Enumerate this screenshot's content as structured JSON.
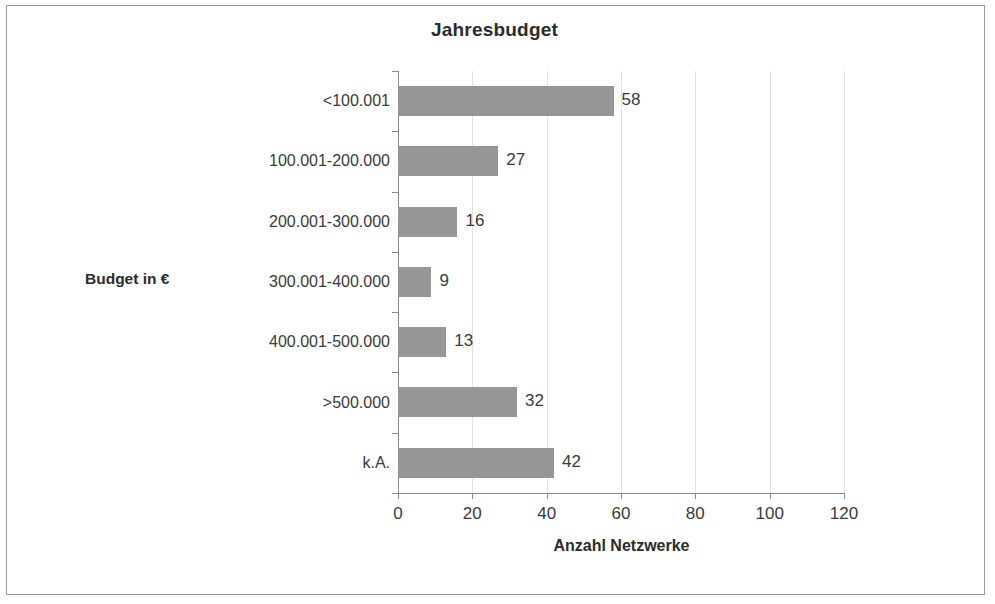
{
  "chart_data": {
    "type": "bar",
    "orientation": "horizontal",
    "title": "Jahresbudget",
    "xlabel": "Anzahl Netzwerke",
    "ylabel": "Budget in €",
    "categories": [
      "<100.001",
      "100.001-200.000",
      "200.001-300.000",
      "300.001-400.000",
      "400.001-500.000",
      ">500.000",
      "k.A."
    ],
    "values": [
      58,
      27,
      16,
      9,
      13,
      32,
      42
    ],
    "value_labels": [
      "58",
      "27",
      "16",
      "9",
      "13",
      "32",
      "42"
    ],
    "xlim": [
      0,
      120
    ],
    "xticks": [
      0,
      20,
      40,
      60,
      80,
      100,
      120
    ],
    "xtick_labels": [
      "0",
      "20",
      "40",
      "60",
      "80",
      "100",
      "120"
    ],
    "grid": "vertical",
    "legend": null,
    "bar_color": "#969696",
    "gridline_color": "#e3e3e3",
    "axis_color": "#8a8a8a",
    "text_color": "#3a3a3a"
  }
}
